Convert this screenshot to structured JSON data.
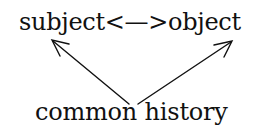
{
  "diagram": {
    "top_label": "subject<—>object",
    "nodes": {
      "subject": "subject",
      "object": "object",
      "common_history": "common history"
    },
    "bottom_label": "common history",
    "edges": [
      {
        "from": "subject",
        "to": "object",
        "type": "bidirectional"
      },
      {
        "from": "common history",
        "to": "subject",
        "type": "arrow"
      },
      {
        "from": "common history",
        "to": "object",
        "type": "arrow"
      }
    ],
    "colors": {
      "ink": "#111111",
      "background": "#ffffff"
    }
  }
}
